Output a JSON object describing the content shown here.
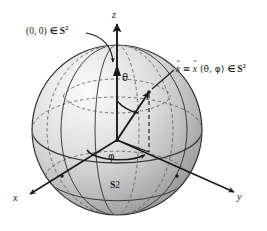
{
  "figure": {
    "type": "3d-sphere-diagram",
    "background_color": "#ffffff",
    "line_color": "#1a1a1a",
    "sphere_fill_light": "#f2f2f2",
    "sphere_fill_mid": "#c8c8c8",
    "sphere_fill_dark": "#8f8f8f",
    "sphere": {
      "center": {
        "x": 117,
        "y": 130
      },
      "radius": 85,
      "label_bottom": "S",
      "label_bottom_sup": "2"
    }
  },
  "axes": [
    {
      "name": "z-axis",
      "label": "z",
      "direction": "up",
      "label_pos": {
        "x": 114,
        "y": 13
      }
    },
    {
      "name": "x-axis",
      "label": "x",
      "direction": "lower-left",
      "label_pos": {
        "x": 16,
        "y": 199
      }
    },
    {
      "name": "y-axis",
      "label": "y",
      "direction": "lower-right",
      "label_pos": {
        "x": 239,
        "y": 199
      }
    }
  ],
  "angles": [
    {
      "name": "theta",
      "symbol": "θ",
      "description": "polar angle from z-axis",
      "label_pos": {
        "x": 125,
        "y": 78
      }
    },
    {
      "name": "phi",
      "symbol": "φ",
      "description": "azimuthal angle in xy-plane",
      "label_pos": {
        "x": 110,
        "y": 157
      }
    }
  ],
  "annotations": [
    {
      "name": "north-pole-label",
      "text_parts": {
        "coords": "(0, 0)",
        "isin": "∈",
        "set": "S",
        "sup": "2"
      },
      "pos": {
        "x": 26,
        "y": 28
      },
      "points_to": {
        "x": 113,
        "y": 68
      }
    },
    {
      "name": "point-label",
      "text_parts": {
        "var": "x",
        "hat": "ˆ",
        "equiv": "≡",
        "args": "(θ, φ)",
        "isin": "∈",
        "set": "S",
        "sup": "2"
      },
      "pos": {
        "x": 176,
        "y": 66
      },
      "points_to": {
        "x": 148,
        "y": 91
      }
    }
  ],
  "markers": [
    {
      "name": "north-pole-point",
      "x": 114,
      "y": 67
    },
    {
      "name": "unit-vector-tip",
      "x": 148,
      "y": 91
    },
    {
      "name": "origin",
      "x": 117,
      "y": 140
    },
    {
      "name": "x-axis-intersection",
      "x": 62,
      "y": 176
    },
    {
      "name": "y-axis-intersection",
      "x": 177,
      "y": 176
    }
  ]
}
